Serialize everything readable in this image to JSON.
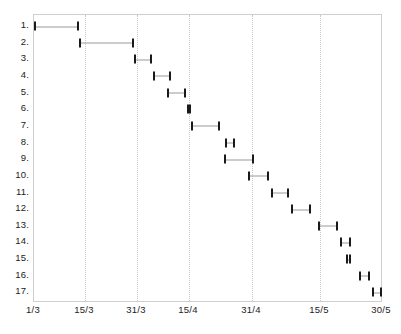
{
  "chart_data": {
    "type": "bar",
    "orientation": "horizontal-interval",
    "title": "",
    "subtitle": "",
    "xlabel": "",
    "ylabel": "",
    "grid": true,
    "legend": null,
    "x_axis": {
      "type": "date",
      "tick_labels": [
        "1/3",
        "15/3",
        "31/3",
        "15/4",
        "31/4",
        "15/5",
        "30/5"
      ],
      "tick_values": [
        0,
        14,
        30,
        45,
        61,
        75,
        90
      ],
      "xlim": [
        0,
        90
      ],
      "tick_px": [
        33,
        84,
        136,
        188,
        251,
        319,
        381
      ]
    },
    "y_axis": {
      "tick_labels": [
        "1.",
        "2.",
        "3.",
        "4.",
        "5.",
        "6.",
        "7.",
        "8.",
        "9.",
        "10.",
        "11.",
        "12.",
        "13.",
        "14.",
        "15.",
        "16.",
        "17."
      ],
      "ylim": [
        0.5,
        17.5
      ],
      "inverted": true
    },
    "categories": [
      "1.",
      "2.",
      "3.",
      "4.",
      "5.",
      "6.",
      "7.",
      "8.",
      "9.",
      "10.",
      "11.",
      "12.",
      "13.",
      "14.",
      "15.",
      "16.",
      "17."
    ],
    "series": [
      {
        "name": "task-duration",
        "intervals": [
          {
            "row": 1,
            "label": "1.",
            "start": "1/3",
            "end": "13/3",
            "start_px": 33,
            "end_px": 78
          },
          {
            "row": 2,
            "label": "2.",
            "start": "13/3",
            "end": "30/3",
            "start_px": 78,
            "end_px": 133
          },
          {
            "row": 3,
            "label": "3.",
            "start": "30/3",
            "end": "5/4",
            "start_px": 133,
            "end_px": 151
          },
          {
            "row": 4,
            "label": "4.",
            "start": "5/4",
            "end": "11/4",
            "start_px": 152,
            "end_px": 170
          },
          {
            "row": 5,
            "label": "5.",
            "start": "10/4",
            "end": "16/4",
            "start_px": 166,
            "end_px": 185
          },
          {
            "row": 6,
            "label": "6.",
            "start": "16/4",
            "end": "17/4",
            "start_px": 186,
            "end_px": 190
          },
          {
            "row": 7,
            "label": "7.",
            "start": "17/4",
            "end": "26/4",
            "start_px": 190,
            "end_px": 219
          },
          {
            "row": 8,
            "label": "8.",
            "start": "27/4",
            "end": "30/4",
            "start_px": 224,
            "end_px": 234
          },
          {
            "row": 9,
            "label": "9.",
            "start": "27/4",
            "end": "6/5",
            "start_px": 223,
            "end_px": 253
          },
          {
            "row": 10,
            "label": "10.",
            "start": "8/5",
            "end": "14/5",
            "start_px": 247,
            "end_px": 268
          },
          {
            "row": 11,
            "label": "11.",
            "start": "14/5",
            "end": "19/5",
            "start_px": 270,
            "end_px": 288
          },
          {
            "row": 12,
            "label": "12.",
            "start": "20/5",
            "end": "26/5",
            "start_px": 290,
            "end_px": 310
          },
          {
            "row": 13,
            "label": "13.",
            "start": "15/5",
            "end": "21/5",
            "start_px": 317,
            "end_px": 337
          },
          {
            "row": 14,
            "label": "14.",
            "start": "22/5",
            "end": "25/5",
            "start_px": 339,
            "end_px": 350
          },
          {
            "row": 15,
            "label": "15.",
            "start": "25/5",
            "end": "26/5",
            "start_px": 345,
            "end_px": 350
          },
          {
            "row": 16,
            "label": "16.",
            "start": "27/5",
            "end": "29/5",
            "start_px": 358,
            "end_px": 369
          },
          {
            "row": 17,
            "label": "17.",
            "start": "29/5",
            "end": "30/5",
            "start_px": 371,
            "end_px": 381
          }
        ]
      }
    ],
    "colors": {
      "cap": "#1a1a1a",
      "spine": "#9a9a9a",
      "gridline": "#c8c8c8",
      "frame": "#cfcfcf",
      "text": "#222222",
      "background": "#ffffff"
    }
  },
  "layout": {
    "plot": {
      "left": 33,
      "top": 14,
      "width": 349,
      "height": 288
    },
    "row_top": 25,
    "row_step": 16.65
  }
}
